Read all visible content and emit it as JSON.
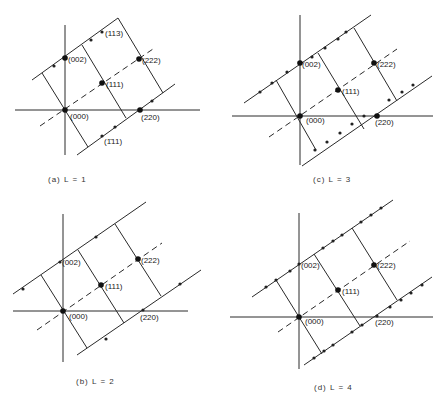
{
  "figure": {
    "panels": [
      {
        "id": "a",
        "caption": "(a)   L = 1",
        "caption_pos": [
          48,
          182
        ],
        "axes": {
          "h": [
            15,
            110,
            200,
            110
          ],
          "v": [
            65,
            25,
            65,
            155
          ]
        },
        "solid_lines": [
          [
            32,
            80,
            118,
            18
          ],
          [
            77,
            155,
            175,
            84
          ],
          [
            42,
            73,
            88,
            147
          ],
          [
            82,
            45,
            126,
            118
          ],
          [
            118,
            18,
            163,
            93
          ]
        ],
        "dashed_lines": [
          [
            40,
            126,
            153,
            49
          ]
        ],
        "big_points": [
          [
            65,
            110
          ],
          [
            65,
            58
          ],
          [
            102,
            83
          ],
          [
            139,
            59
          ],
          [
            140,
            110
          ]
        ],
        "small_points": [
          [
            54,
            66
          ],
          [
            91,
            40
          ],
          [
            102,
            32
          ],
          [
            152,
            101
          ],
          [
            115,
            127
          ],
          [
            102,
            136
          ]
        ],
        "labels": [
          {
            "text": "(000)",
            "x": 70,
            "y": 119
          },
          {
            "text": "(002)",
            "x": 68,
            "y": 62
          },
          {
            "text": "(113)",
            "x": 105,
            "y": 36
          },
          {
            "text": "(222)",
            "x": 142,
            "y": 63
          },
          {
            "text": "(111)",
            "x": 106,
            "y": 87
          },
          {
            "text": "(220)",
            "x": 141,
            "y": 120
          },
          {
            "text": "(1̄11)",
            "x": 104,
            "y": 144
          }
        ]
      },
      {
        "id": "c",
        "caption": "(c)   L = 3",
        "caption_pos": [
          313,
          182
        ],
        "axes": {
          "h": [
            232,
            116,
            433,
            116
          ],
          "v": [
            300,
            15,
            300,
            165
          ]
        },
        "solid_lines": [
          [
            244,
            103,
            371,
            15
          ],
          [
            302,
            166,
            432,
            76
          ],
          [
            276,
            80,
            316,
            150
          ],
          [
            318,
            53,
            364,
            129
          ],
          [
            354,
            28,
            397,
            101
          ]
        ],
        "dashed_lines": [
          [
            269,
            137,
            397,
            49
          ]
        ],
        "big_points": [
          [
            300,
            116
          ],
          [
            300,
            63
          ],
          [
            338,
            90
          ],
          [
            374,
            63
          ],
          [
            377,
            116
          ]
        ],
        "small_points": [
          [
            260,
            92
          ],
          [
            272,
            83
          ],
          [
            287,
            72
          ],
          [
            312,
            57
          ],
          [
            325,
            48
          ],
          [
            338,
            39
          ],
          [
            346,
            32
          ],
          [
            315,
            150
          ],
          [
            327,
            142
          ],
          [
            340,
            133
          ],
          [
            352,
            124
          ],
          [
            364,
            116
          ],
          [
            389,
            100
          ],
          [
            402,
            92
          ],
          [
            413,
            85
          ]
        ],
        "labels": [
          {
            "text": "(000)",
            "x": 306,
            "y": 123
          },
          {
            "text": "(002)",
            "x": 302,
            "y": 67
          },
          {
            "text": "(222)",
            "x": 377,
            "y": 67
          },
          {
            "text": "(111)",
            "x": 342,
            "y": 94
          },
          {
            "text": "(220)",
            "x": 375,
            "y": 125
          }
        ]
      },
      {
        "id": "b",
        "caption": "(b)   L = 2",
        "caption_pos": [
          76,
          384
        ],
        "axes": {
          "h": [
            13,
            311,
            188,
            311
          ],
          "v": [
            63,
            214,
            63,
            362
          ]
        },
        "solid_lines": [
          [
            13,
            294,
            146,
            202
          ],
          [
            77,
            355,
            201,
            270
          ],
          [
            41,
            275,
            87,
            348
          ],
          [
            78,
            250,
            124,
            323
          ],
          [
            115,
            224,
            161,
            296
          ]
        ],
        "dashed_lines": [
          [
            37,
            330,
            162,
            243
          ]
        ],
        "big_points": [
          [
            63,
            311
          ],
          [
            101,
            285
          ],
          [
            138,
            259
          ]
        ],
        "small_points": [
          [
            23,
            289
          ],
          [
            60,
            262
          ],
          [
            96,
            237
          ],
          [
            106,
            339
          ],
          [
            143,
            310
          ],
          [
            180,
            284
          ]
        ],
        "labels": [
          {
            "text": "(000)",
            "x": 69,
            "y": 319
          },
          {
            "text": "(002)",
            "x": 62,
            "y": 265
          },
          {
            "text": "(222)",
            "x": 141,
            "y": 263
          },
          {
            "text": "(111)",
            "x": 105,
            "y": 289
          },
          {
            "text": "(220)",
            "x": 140,
            "y": 320
          }
        ]
      },
      {
        "id": "d",
        "caption": "(d)   L = 4",
        "caption_pos": [
          314,
          390
        ],
        "axes": {
          "h": [
            230,
            317,
            433,
            317
          ],
          "v": [
            299,
            213,
            299,
            369
          ]
        },
        "solid_lines": [
          [
            252,
            297,
            393,
            200
          ],
          [
            304,
            365,
            432,
            277
          ],
          [
            276,
            280,
            322,
            354
          ],
          [
            314,
            254,
            360,
            326
          ],
          [
            352,
            228,
            397,
            300
          ]
        ],
        "dashed_lines": [
          [
            278,
            332,
            410,
            241
          ]
        ],
        "big_points": [
          [
            299,
            317
          ],
          [
            338,
            290
          ],
          [
            374,
            265
          ]
        ],
        "small_points": [
          [
            266,
            287
          ],
          [
            276,
            280
          ],
          [
            290,
            271
          ],
          [
            299,
            264
          ],
          [
            323,
            248
          ],
          [
            333,
            241
          ],
          [
            342,
            235
          ],
          [
            361,
            222
          ],
          [
            371,
            215
          ],
          [
            381,
            208
          ],
          [
            314,
            358
          ],
          [
            324,
            351
          ],
          [
            333,
            345
          ],
          [
            352,
            332
          ],
          [
            362,
            325
          ],
          [
            377,
            316
          ],
          [
            390,
            307
          ],
          [
            401,
            300
          ],
          [
            411,
            293
          ],
          [
            422,
            285
          ]
        ],
        "labels": [
          {
            "text": "(000)",
            "x": 305,
            "y": 324
          },
          {
            "text": "(002)",
            "x": 301,
            "y": 268
          },
          {
            "text": "(222)",
            "x": 377,
            "y": 268
          },
          {
            "text": "(111)",
            "x": 342,
            "y": 294
          },
          {
            "text": "(220)",
            "x": 375,
            "y": 325
          }
        ]
      }
    ]
  }
}
